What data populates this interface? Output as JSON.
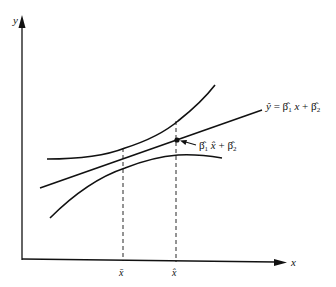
{
  "diagram": {
    "type": "regression-confidence-band",
    "axes": {
      "x_label": "x",
      "y_label": "y"
    },
    "fitted_line_label": {
      "y": "ŷ",
      "eq": " = ",
      "b1": "β̂",
      "b1_sub": "1",
      "x": " x",
      "plus": " + ",
      "b2": "β̂",
      "b2_sub": "2"
    },
    "point_label": {
      "b1": "β̂",
      "b1_sub": "1",
      "xhat": " x̂",
      "plus": " + ",
      "b2": "β̂",
      "b2_sub": "2"
    },
    "tick_labels": {
      "xbar": "x̄",
      "xhat": "x̂"
    },
    "colors": {
      "line": "#111111",
      "background": "#ffffff"
    }
  }
}
